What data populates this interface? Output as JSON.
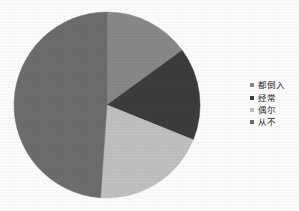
{
  "chart_data": {
    "type": "pie",
    "title": "",
    "subtitle": "",
    "xlabel": "",
    "ylabel": "",
    "grid": false,
    "legend_position": "right",
    "start_angle_deg": 0,
    "direction": "clockwise",
    "center": {
      "x": 107,
      "y": 105
    },
    "radius": 93,
    "categories": [
      "都倒入",
      "经常",
      "偶尔",
      "从不"
    ],
    "values": [
      15,
      16,
      20,
      49
    ],
    "unit": "%",
    "slices": [
      {
        "label": "都倒入",
        "value": 15,
        "color": "#8a8a8a",
        "start_deg": 0,
        "end_deg": 54,
        "swatch_color": "#8a8a8a"
      },
      {
        "label": "经常",
        "value": 16,
        "color": "#3d3d3d",
        "start_deg": 54,
        "end_deg": 112,
        "swatch_color": "#3d3d3d"
      },
      {
        "label": "偶尔",
        "value": 20,
        "color": "#c2c2c2",
        "start_deg": 112,
        "end_deg": 184,
        "swatch_color": "#c2c2c2"
      },
      {
        "label": "从不",
        "value": 49,
        "color": "#6e6e6e",
        "start_deg": 184,
        "end_deg": 360,
        "swatch_color": "#6e6e6e"
      }
    ],
    "colors": [
      "#8a8a8a",
      "#3d3d3d",
      "#c2c2c2",
      "#6e6e6e"
    ]
  },
  "legend": {
    "items": [
      {
        "label": "都倒入",
        "color": "#8a8a8a"
      },
      {
        "label": "经常",
        "color": "#3d3d3d"
      },
      {
        "label": "偶尔",
        "color": "#c2c2c2"
      },
      {
        "label": "从不",
        "color": "#6e6e6e"
      }
    ]
  },
  "canvas": {
    "background": "#ffffff",
    "width": 299,
    "height": 211
  }
}
